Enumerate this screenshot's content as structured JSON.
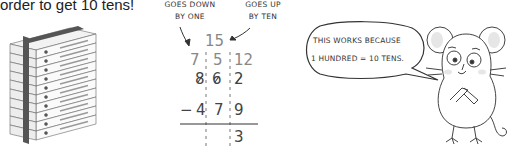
{
  "caption": "order to get 10 tens!",
  "annotations": {
    "left_line1": "GOES DOWN",
    "left_line2": "BY ONE",
    "right_line1": "GOES UP",
    "right_line2": "BY TEN"
  },
  "subtraction": {
    "regroup_top": "15",
    "regroup_row": [
      "7",
      "5",
      "12"
    ],
    "minuend": [
      "8",
      "6",
      "2"
    ],
    "operator": "−",
    "subtrahend": [
      "4",
      "7",
      "9"
    ],
    "result": [
      "",
      "",
      "3"
    ]
  },
  "speech_bubble": {
    "line1": "THIS WORKS BECAUSE",
    "line2": "1 HUNDRED = 10 TENS."
  },
  "illustrations": {
    "left": "stack-of-ten-boxes",
    "right": "worried-mouse"
  }
}
